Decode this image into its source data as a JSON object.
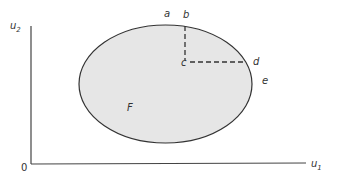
{
  "diagram": {
    "type": "utility-possibility-set",
    "colors": {
      "axis": "#444444",
      "outline": "#333333",
      "fill": "#e6e6e6",
      "dashed": "#333333",
      "text": "#333333",
      "background": "#ffffff"
    },
    "axes": {
      "y_label_main": "u",
      "y_label_sub": "2",
      "x_label_main": "u",
      "x_label_sub": "1",
      "origin_label": "0"
    },
    "region": {
      "label": "F",
      "shape": "ellipse"
    },
    "points": [
      {
        "id": "a",
        "label": "a"
      },
      {
        "id": "b",
        "label": "b"
      },
      {
        "id": "c",
        "label": "c"
      },
      {
        "id": "d",
        "label": "d"
      },
      {
        "id": "e",
        "label": "e"
      }
    ],
    "dashed_lines": [
      {
        "from": "b",
        "to": "c",
        "orientation": "vertical"
      },
      {
        "from": "c",
        "to": "d",
        "orientation": "horizontal"
      }
    ]
  }
}
